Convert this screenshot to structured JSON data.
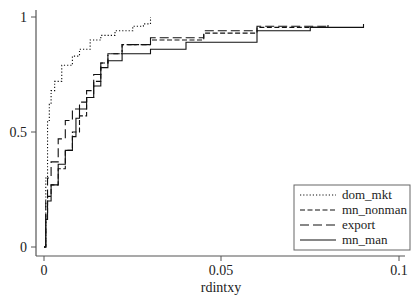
{
  "chart_data": {
    "type": "line",
    "title": "",
    "xlabel": "rdintxy",
    "ylabel": "",
    "xlim": [
      0,
      0.1
    ],
    "ylim": [
      0,
      1
    ],
    "x_ticks": [
      "0",
      "0.05",
      "0.1"
    ],
    "y_ticks": [
      "0",
      "0.5",
      "1"
    ],
    "grid": false,
    "legend_position": "lower right",
    "series": [
      {
        "name": "dom_mkt",
        "style": "dotted",
        "points": [
          [
            0,
            0.0
          ],
          [
            0.0005,
            0.3
          ],
          [
            0.001,
            0.55
          ],
          [
            0.0015,
            0.62
          ],
          [
            0.002,
            0.68
          ],
          [
            0.003,
            0.72
          ],
          [
            0.005,
            0.79
          ],
          [
            0.008,
            0.83
          ],
          [
            0.01,
            0.86
          ],
          [
            0.013,
            0.9
          ],
          [
            0.016,
            0.92
          ],
          [
            0.02,
            0.94
          ],
          [
            0.025,
            0.96
          ],
          [
            0.028,
            0.97
          ],
          [
            0.03,
            1.0
          ]
        ]
      },
      {
        "name": "mn_nonman",
        "style": "short-dash",
        "points": [
          [
            0,
            0.0
          ],
          [
            0.0005,
            0.15
          ],
          [
            0.001,
            0.22
          ],
          [
            0.002,
            0.27
          ],
          [
            0.004,
            0.34
          ],
          [
            0.006,
            0.42
          ],
          [
            0.008,
            0.5
          ],
          [
            0.01,
            0.57
          ],
          [
            0.012,
            0.65
          ],
          [
            0.014,
            0.72
          ],
          [
            0.016,
            0.8
          ],
          [
            0.018,
            0.84
          ],
          [
            0.022,
            0.88
          ],
          [
            0.03,
            0.9
          ],
          [
            0.045,
            0.93
          ],
          [
            0.06,
            0.955
          ],
          [
            0.08,
            0.965
          ]
        ]
      },
      {
        "name": "export",
        "style": "long-dash",
        "points": [
          [
            0,
            0.0
          ],
          [
            0.0005,
            0.2
          ],
          [
            0.001,
            0.3
          ],
          [
            0.002,
            0.37
          ],
          [
            0.004,
            0.47
          ],
          [
            0.006,
            0.55
          ],
          [
            0.008,
            0.6
          ],
          [
            0.01,
            0.63
          ],
          [
            0.012,
            0.68
          ],
          [
            0.014,
            0.75
          ],
          [
            0.016,
            0.8
          ],
          [
            0.018,
            0.84
          ],
          [
            0.022,
            0.88
          ],
          [
            0.03,
            0.91
          ],
          [
            0.045,
            0.94
          ],
          [
            0.06,
            0.96
          ],
          [
            0.08,
            0.97
          ]
        ]
      },
      {
        "name": "mn_man",
        "style": "solid",
        "points": [
          [
            0,
            0.0
          ],
          [
            0.0005,
            0.12
          ],
          [
            0.001,
            0.2
          ],
          [
            0.002,
            0.27
          ],
          [
            0.004,
            0.36
          ],
          [
            0.006,
            0.42
          ],
          [
            0.008,
            0.48
          ],
          [
            0.009,
            0.56
          ],
          [
            0.01,
            0.6
          ],
          [
            0.012,
            0.65
          ],
          [
            0.014,
            0.7
          ],
          [
            0.016,
            0.78
          ],
          [
            0.018,
            0.81
          ],
          [
            0.022,
            0.84
          ],
          [
            0.03,
            0.86
          ],
          [
            0.04,
            0.89
          ],
          [
            0.06,
            0.94
          ],
          [
            0.075,
            0.955
          ],
          [
            0.09,
            0.97
          ]
        ]
      }
    ]
  },
  "axes": {
    "x_label": "rdintxy",
    "x_tick_labels": [
      "0",
      "0.05",
      "0.1"
    ],
    "y_tick_labels": [
      "0",
      "0.5",
      "1"
    ]
  },
  "legend": {
    "items": [
      {
        "label": "dom_mkt",
        "style": "dotted"
      },
      {
        "label": "mn_nonman",
        "style": "short-dash"
      },
      {
        "label": "export",
        "style": "long-dash"
      },
      {
        "label": "mn_man",
        "style": "solid"
      }
    ]
  },
  "colors": {
    "line": "#111111",
    "axis": "#555555",
    "legend_border": "#666666"
  }
}
